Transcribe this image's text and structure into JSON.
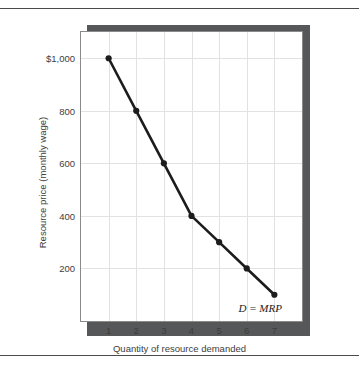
{
  "chart_data": {
    "type": "line",
    "title": "",
    "xlabel": "Quantity of resource demanded",
    "ylabel": "Resource price (monthly wage)",
    "x": [
      1,
      2,
      3,
      4,
      5,
      6,
      7
    ],
    "values": [
      1000,
      800,
      600,
      400,
      300,
      200,
      100
    ],
    "series": [
      {
        "name": "D = MRP",
        "values": [
          1000,
          800,
          600,
          400,
          300,
          200,
          100
        ]
      }
    ],
    "xlim": [
      0,
      8
    ],
    "ylim": [
      0,
      1100
    ],
    "xtick_labels": [
      "1",
      "2",
      "3",
      "4",
      "5",
      "6",
      "7"
    ],
    "ytick_values": [
      200,
      400,
      600,
      800,
      1000
    ],
    "ytick_labels": [
      "200",
      "400",
      "600",
      "800",
      "$1,000"
    ],
    "grid": true,
    "legend_position": "none",
    "annotations": [
      {
        "text": "D = MRP",
        "x": 6.45,
        "y": 55
      }
    ],
    "colors": {
      "series_line": "#1c1c1c",
      "marker": "#1c1c1c",
      "gridline": "#e2e2e2",
      "frame_border": "#8a8a8a",
      "shadow": "#555759",
      "rule": "#4a4a4a",
      "text": "#3d3d3d",
      "background": "#ffffff"
    }
  }
}
